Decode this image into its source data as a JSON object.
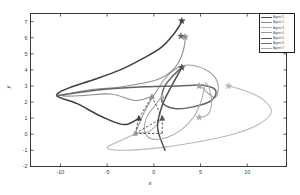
{
  "figure": {
    "xlabel": "x",
    "ylabel": "y",
    "title": ""
  },
  "axes": {
    "xticks": [
      "-10",
      "-5",
      "0",
      "5",
      "10"
    ],
    "xtick_values": [
      -10,
      -5,
      0,
      5,
      10
    ],
    "yticks": [
      "-2",
      "-1",
      "0",
      "1",
      "2",
      "3",
      "4",
      "5",
      "6",
      "7"
    ],
    "ytick_values": [
      -2,
      -1,
      0,
      1,
      2,
      3,
      4,
      5,
      6,
      7
    ],
    "xlim": [
      -13.2,
      14.2
    ],
    "ylim": [
      -2.0,
      7.5
    ]
  },
  "legend": {
    "position": "top-right",
    "entries": [
      {
        "label": "Agent 1",
        "color": "#4a4a4a"
      },
      {
        "label": "Agent 2",
        "color": "#8c8c8c"
      },
      {
        "label": "Agent 3",
        "color": "#b4b4b4"
      },
      {
        "label": "Agent 4",
        "color": "#9a9a9a"
      },
      {
        "label": "Agent 5",
        "color": "#5a5a5a"
      },
      {
        "label": "Agent 6",
        "color": "#707070"
      },
      {
        "label": "Agent 7",
        "color": "#a8a8a8"
      }
    ]
  },
  "chart_data": {
    "type": "line",
    "title": "",
    "xlabel": "x",
    "ylabel": "y",
    "xlim": [
      -13.2,
      14.2
    ],
    "ylim": [
      -2.0,
      7.5
    ],
    "grid": false,
    "legend_position": "top-right",
    "marker_start": "triangle",
    "marker_end": "star",
    "series": [
      {
        "name": "Agent 1",
        "color": "#3f3f3f",
        "width": 1.5,
        "start": [
          -1.6,
          1.0
        ],
        "end": [
          3.0,
          7.05
        ],
        "points": [
          [
            -1.6,
            1.0
          ],
          [
            -3.2,
            0.6
          ],
          [
            -5.6,
            1.1
          ],
          [
            -8.2,
            1.9
          ],
          [
            -10.4,
            2.4
          ],
          [
            -9.0,
            2.9
          ],
          [
            -6.4,
            3.4
          ],
          [
            -3.6,
            4.0
          ],
          [
            -1.2,
            4.7
          ],
          [
            0.8,
            5.4
          ],
          [
            2.1,
            6.2
          ],
          [
            2.8,
            6.8
          ],
          [
            3.0,
            7.05
          ]
        ]
      },
      {
        "name": "Agent 2",
        "color": "#8f8f8f",
        "width": 1.1,
        "start": [
          -0.2,
          2.35
        ],
        "end": [
          3.35,
          6.05
        ],
        "points": [
          [
            -0.2,
            2.35
          ],
          [
            -2.0,
            2.1
          ],
          [
            -4.6,
            2.5
          ],
          [
            -7.6,
            2.4
          ],
          [
            -9.8,
            2.4
          ],
          [
            -7.0,
            2.75
          ],
          [
            -3.4,
            2.95
          ],
          [
            0.4,
            3.4
          ],
          [
            2.2,
            4.1
          ],
          [
            3.0,
            4.9
          ],
          [
            3.3,
            5.6
          ],
          [
            3.35,
            6.05
          ]
        ]
      },
      {
        "name": "Agent 3",
        "color": "#b8b8b8",
        "width": 1.1,
        "start": [
          0.9,
          1.0
        ],
        "end": [
          8.0,
          3.0
        ],
        "points": [
          [
            0.9,
            1.0
          ],
          [
            -0.4,
            0.2
          ],
          [
            -1.8,
            0.05
          ],
          [
            -3.6,
            -0.4
          ],
          [
            -5.0,
            -0.85
          ],
          [
            -3.0,
            -1.0
          ],
          [
            0.5,
            -0.85
          ],
          [
            4.5,
            -0.5
          ],
          [
            8.5,
            0.0
          ],
          [
            11.2,
            0.6
          ],
          [
            12.6,
            1.4
          ],
          [
            11.6,
            2.2
          ],
          [
            9.8,
            2.7
          ],
          [
            8.0,
            3.0
          ]
        ]
      },
      {
        "name": "Agent 4",
        "color": "#9e9e9e",
        "width": 1.1,
        "start": [
          -2.0,
          0.05
        ],
        "end": [
          4.85,
          3.0
        ],
        "points": [
          [
            -2.0,
            0.05
          ],
          [
            -1.0,
            1.4
          ],
          [
            0.2,
            2.6
          ],
          [
            1.4,
            3.6
          ],
          [
            3.0,
            4.25
          ],
          [
            4.8,
            4.2
          ],
          [
            6.3,
            3.7
          ],
          [
            6.9,
            3.0
          ],
          [
            6.6,
            2.3
          ],
          [
            5.7,
            2.6
          ],
          [
            5.2,
            2.9
          ],
          [
            4.85,
            3.0
          ]
        ]
      },
      {
        "name": "Agent 5",
        "color": "#4f4f4f",
        "width": 1.5,
        "start": [
          1.2,
          -1.0
        ],
        "end": [
          3.0,
          4.15
        ],
        "points": [
          [
            1.2,
            -1.0
          ],
          [
            0.4,
            0.4
          ],
          [
            0.9,
            1.8
          ],
          [
            1.9,
            3.0
          ],
          [
            3.0,
            4.15
          ]
        ]
      },
      {
        "name": "Agent 6",
        "color": "#636363",
        "width": 1.5,
        "start": [
          -10.4,
          2.4
        ],
        "end": [
          3.0,
          4.15
        ],
        "points": [
          [
            -10.4,
            2.4
          ],
          [
            -6.0,
            2.75
          ],
          [
            -1.0,
            2.95
          ],
          [
            2.6,
            3.0
          ],
          [
            5.2,
            3.05
          ],
          [
            6.6,
            2.75
          ],
          [
            6.2,
            2.1
          ],
          [
            4.2,
            1.7
          ],
          [
            2.2,
            1.6
          ],
          [
            0.9,
            2.0
          ],
          [
            1.1,
            2.9
          ],
          [
            2.0,
            3.6
          ],
          [
            3.0,
            4.15
          ]
        ]
      },
      {
        "name": "Agent 7",
        "color": "#adadad",
        "width": 1.1,
        "start": [
          0.9,
          2.35
        ],
        "end": [
          4.85,
          1.05
        ],
        "points": [
          [
            0.9,
            2.35
          ],
          [
            0.0,
            1.7
          ],
          [
            -0.8,
            1.0
          ],
          [
            -1.0,
            0.2
          ],
          [
            -0.2,
            -0.3
          ],
          [
            1.4,
            -0.2
          ],
          [
            3.0,
            0.3
          ],
          [
            4.3,
            1.1
          ],
          [
            5.1,
            2.1
          ],
          [
            5.6,
            3.2
          ],
          [
            6.2,
            2.2
          ],
          [
            6.0,
            1.4
          ],
          [
            5.4,
            1.1
          ],
          [
            4.85,
            1.05
          ]
        ]
      }
    ],
    "initial_positions": [
      {
        "agent": "Agent 1",
        "x": -1.6,
        "y": 1.0
      },
      {
        "agent": "Agent 2",
        "x": -0.2,
        "y": 2.35
      },
      {
        "agent": "Agent 5",
        "x": 0.9,
        "y": 1.0
      },
      {
        "agent": "Agent 4",
        "x": -2.0,
        "y": 0.05
      },
      {
        "agent": "Agent 7",
        "x": 0.9,
        "y": 2.35
      }
    ],
    "final_positions": [
      {
        "agent": "Agent 1",
        "x": 3.0,
        "y": 7.05
      },
      {
        "agent": "Agent 2",
        "x": 3.35,
        "y": 6.05
      },
      {
        "agent": "Agent 6",
        "x": 2.9,
        "y": 6.1
      },
      {
        "agent": "Agent 5",
        "x": 3.0,
        "y": 4.15
      },
      {
        "agent": "Agent 4",
        "x": 4.85,
        "y": 3.0
      },
      {
        "agent": "Agent 3",
        "x": 8.0,
        "y": 3.0
      },
      {
        "agent": "Agent 7",
        "x": 4.85,
        "y": 1.05
      }
    ],
    "network_edges": [
      {
        "from": [
          -2.0,
          0.05
        ],
        "to": [
          0.9,
          1.0
        ]
      },
      {
        "from": [
          -2.0,
          0.05
        ],
        "to": [
          -1.6,
          1.0
        ]
      },
      {
        "from": [
          -2.0,
          0.05
        ],
        "to": [
          0.9,
          0.05
        ]
      },
      {
        "from": [
          -1.6,
          1.0
        ],
        "to": [
          -0.2,
          2.35
        ]
      },
      {
        "from": [
          -0.2,
          2.35
        ],
        "to": [
          0.9,
          1.0
        ]
      },
      {
        "from": [
          0.9,
          1.0
        ],
        "to": [
          0.9,
          0.05
        ]
      }
    ]
  }
}
